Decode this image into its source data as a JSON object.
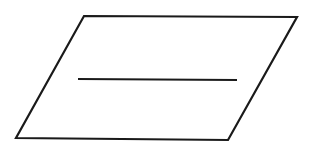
{
  "diagram": {
    "type": "parallelogram-symbol",
    "stroke_color": "#1a1a1a",
    "background_color": "#ffffff",
    "shape": {
      "name": "parallelogram",
      "points": [
        [
          84,
          16
        ],
        [
          297,
          17
        ],
        [
          228,
          140
        ],
        [
          16,
          138
        ]
      ],
      "stroke_width": 2.2
    },
    "divider_line": {
      "name": "horizontal-line",
      "x1": 78,
      "y1": 79,
      "x2": 237,
      "y2": 80,
      "stroke_width": 2.2
    }
  }
}
